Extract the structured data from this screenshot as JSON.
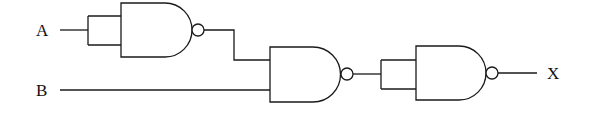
{
  "diagram": {
    "type": "logic-circuit",
    "inputs": [
      {
        "id": "A",
        "label": "A"
      },
      {
        "id": "B",
        "label": "B"
      }
    ],
    "output": {
      "id": "X",
      "label": "X"
    },
    "gates": [
      {
        "id": "gate1",
        "kind": "NAND",
        "inputs": [
          "A",
          "A"
        ],
        "note": "inputs tied together"
      },
      {
        "id": "gate2",
        "kind": "NAND",
        "inputs": [
          "gate1",
          "B"
        ]
      },
      {
        "id": "gate3",
        "kind": "NAND",
        "inputs": [
          "gate2",
          "gate2"
        ],
        "note": "inputs tied together"
      }
    ],
    "colors": {
      "stroke": "#1a1a1a",
      "background": "#ffffff"
    }
  }
}
